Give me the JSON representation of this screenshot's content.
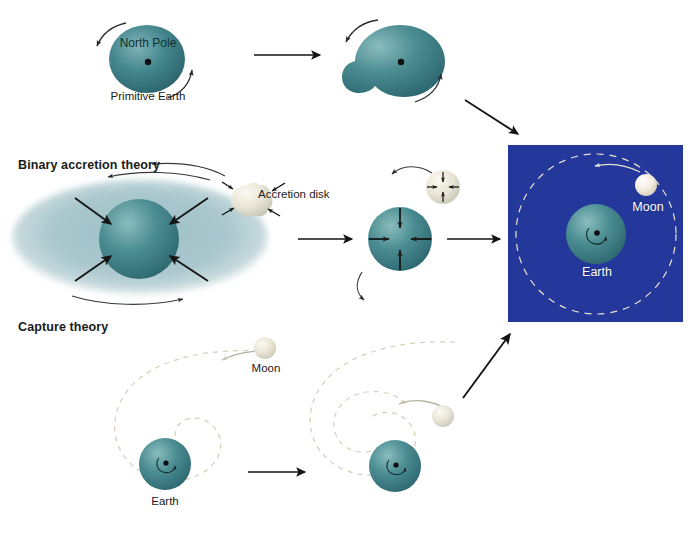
{
  "figure": {
    "type": "diagram",
    "background_color": "#ffffff",
    "width": 690,
    "height": 547
  },
  "palette": {
    "earth_teal": "#39818a",
    "earth_teal_dark": "#2b6a73",
    "earth_teal_light": "#6aa8ad",
    "disk_pale": "#a8c6cc",
    "moon_cream": "#ece9dc",
    "panel_navy": "#23389a",
    "arrow_black": "#141414",
    "orbit_dash": "#cfc6b4",
    "text_dark": "#1a1a1a",
    "text_light": "#ffffff"
  },
  "rows": [
    {
      "id": "fission",
      "heading": "",
      "labels": {
        "north_pole": "North Pole",
        "primitive_earth": "Primitive Earth"
      }
    },
    {
      "id": "binary-accretion",
      "heading": "Binary accretion theory",
      "labels": {
        "accretion_disk": "Accretion disk"
      }
    },
    {
      "id": "capture",
      "heading": "Capture theory",
      "labels": {
        "moon": "Moon",
        "earth": "Earth"
      }
    }
  ],
  "result_panel": {
    "labels": {
      "moon": "Moon",
      "earth": "Earth"
    },
    "background_color": "#23389a"
  },
  "capture_panel_left": {
    "labels": {
      "moon": "Moon",
      "earth": "Earth"
    }
  },
  "arrows": {
    "count_straight": 6,
    "style": "solid triangular head"
  }
}
